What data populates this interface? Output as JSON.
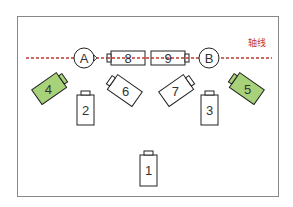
{
  "diagram": {
    "axis_label": "轴线",
    "points": [
      {
        "id": "A",
        "label": "A"
      },
      {
        "id": "B",
        "label": "B"
      }
    ],
    "batteries": [
      {
        "label": "1",
        "highlighted": false
      },
      {
        "label": "2",
        "highlighted": false
      },
      {
        "label": "3",
        "highlighted": false
      },
      {
        "label": "4",
        "highlighted": true
      },
      {
        "label": "5",
        "highlighted": true
      },
      {
        "label": "6",
        "highlighted": false
      },
      {
        "label": "7",
        "highlighted": false
      },
      {
        "label": "8",
        "highlighted": false
      },
      {
        "label": "9",
        "highlighted": false
      }
    ],
    "colors": {
      "axis": "#c0392b",
      "highlight_fill": "#a8d27a",
      "stroke": "#222222",
      "frame": "#888888"
    }
  }
}
